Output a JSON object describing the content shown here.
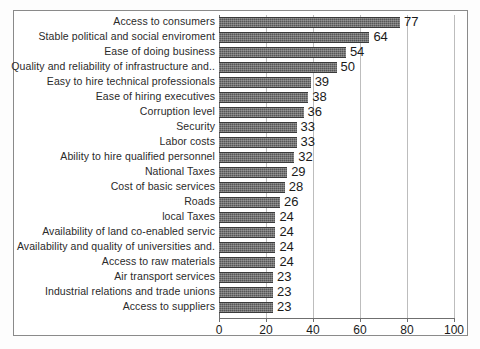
{
  "chart_data": {
    "type": "bar",
    "orientation": "horizontal",
    "title": "",
    "subtitle": "",
    "xlabel": "",
    "ylabel": "",
    "xlim": [
      0,
      100
    ],
    "xticks": [
      0,
      20,
      40,
      60,
      80,
      100
    ],
    "xtick_labels": [
      "0",
      "20",
      "40",
      "60",
      "80",
      "100"
    ],
    "grid": true,
    "grid_axis": "x",
    "legend": false,
    "legend_position": "none",
    "show_data_labels": true,
    "bar_color": "#565656",
    "categories": [
      "Access to consumers",
      "Stable political and social enviroment",
      "Ease of doing business",
      "Quality and reliability of infrastructure and..",
      "Easy to hire technical professionals",
      "Ease of hiring executives",
      "Corruption level",
      "Security",
      "Labor costs",
      "Ability to hire qualified personnel",
      "National Taxes",
      "Cost of basic services",
      "Roads",
      "local Taxes",
      "Availability of land co-enabled servic",
      "Availability and quality of universities and.",
      "Access to raw materials",
      "Air transport services",
      "Industrial relations and trade unions",
      "Access to suppliers"
    ],
    "values": [
      77,
      64,
      54,
      50,
      39,
      38,
      36,
      33,
      33,
      32,
      29,
      28,
      26,
      24,
      24,
      24,
      24,
      23,
      23,
      23
    ],
    "value_labels": [
      "77",
      "64",
      "54",
      "50",
      "39",
      "38",
      "36",
      "33",
      "33",
      "32",
      "29",
      "28",
      "26",
      "24",
      "24",
      "24",
      "24",
      "23",
      "23",
      "23"
    ]
  }
}
